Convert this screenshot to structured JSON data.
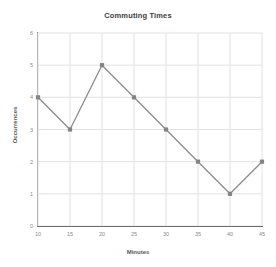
{
  "chart_data": {
    "type": "line",
    "title": "Commuting Times",
    "xlabel": "Minutes",
    "ylabel": "Occurrences",
    "x": [
      10,
      15,
      20,
      25,
      30,
      35,
      40,
      45
    ],
    "values": [
      4,
      3,
      5,
      4,
      3,
      2,
      1,
      2
    ],
    "series": [
      {
        "name": "Occurrences",
        "values": [
          4,
          3,
          5,
          4,
          3,
          2,
          1,
          2
        ]
      }
    ],
    "xticks": [
      "10",
      "15",
      "20",
      "25",
      "30",
      "35",
      "40",
      "45"
    ],
    "yticks": [
      "0",
      "1",
      "2",
      "3",
      "4",
      "5",
      "6"
    ],
    "xlim": [
      10,
      45
    ],
    "ylim": [
      0,
      6
    ],
    "grid": true,
    "legend": false,
    "marker": "square",
    "colors": {
      "line": "#8c8c8c",
      "marker": "#848484",
      "grid": "#e2e2e2",
      "axis": "#8a8a8a",
      "baseline": "#6e6e6e",
      "title_text": "#3c3c3c",
      "tick_text": "#8a8a8a",
      "label_text": "#5a5a5a",
      "background": "#ffffff"
    }
  }
}
